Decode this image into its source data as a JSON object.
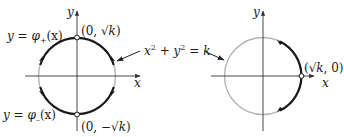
{
  "left_figure": {
    "axis_x_label": "x",
    "axis_y_label": "y",
    "upper_curve_label": "y = φ₊(x)",
    "upper_curve_label_parts": {
      "lhs": "y",
      "eq": " = ",
      "fn": "φ",
      "sub": "+",
      "arg": "(x)"
    },
    "lower_curve_label": "y = φ₋(x)",
    "lower_curve_label_parts": {
      "lhs": "y",
      "eq": " = ",
      "fn": "φ",
      "sub": "–",
      "arg": "(x)"
    },
    "top_point_label": "(0, √k)",
    "top_point_parts": {
      "open": "(0, √",
      "k": "k",
      "close": ")"
    },
    "bottom_point_label": "(0, −√k)",
    "bottom_point_parts": {
      "open": "(0, −√",
      "k": "k",
      "close": ")"
    },
    "highlighted_arcs": [
      "upper semicircle (φ₊)",
      "lower semicircle (φ₋)"
    ],
    "excluded_points": [
      "(0, √k)",
      "(0, −√k)"
    ]
  },
  "shared_label": {
    "text": "x² + y² = k",
    "parts": {
      "x": "x",
      "two1": "2",
      "plus": " + ",
      "y": "y",
      "two2": "2",
      "eq": " = ",
      "k": "k"
    }
  },
  "right_figure": {
    "axis_x_label": "x",
    "axis_y_label": "y",
    "point_label": "(√k, 0)",
    "point_parts": {
      "open": "(√",
      "k": "k",
      "close": ", 0)"
    },
    "highlighted_arcs": [
      "right arc through (√k, 0)"
    ],
    "excluded_points": [
      "(√k, 0)"
    ]
  },
  "colors": {
    "curve_dark": "#1a1a1a",
    "circle_light": "#b5b5b5",
    "axis": "#333333",
    "background": "#ffffff"
  }
}
